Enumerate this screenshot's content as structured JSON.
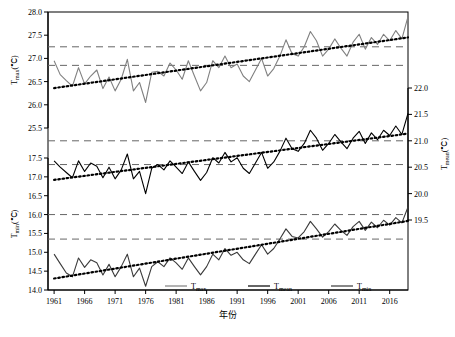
{
  "chart_data": {
    "type": "line",
    "title": "",
    "xlabel": "年份",
    "x_ticks": [
      1961,
      1966,
      1971,
      1976,
      1981,
      1986,
      1991,
      1996,
      2001,
      2006,
      2011,
      2016
    ],
    "xlim": [
      1960,
      2019
    ],
    "panels": [
      {
        "name": "tmax-panel",
        "axis_side": "left",
        "ylabel": "T",
        "ylabel_sub": "max",
        "ylabel_unit": "(℃)",
        "ylim": [
          25.5,
          28.0
        ],
        "y_ticks": [
          25.5,
          26.0,
          26.5,
          27.0,
          27.5,
          28.0
        ],
        "mean_line": 26.85,
        "upper_dashed": 27.25,
        "series_name": "Tmax",
        "color": "#808080",
        "values": [
          26.95,
          26.65,
          26.52,
          26.4,
          26.8,
          26.45,
          26.62,
          26.75,
          26.35,
          26.6,
          26.3,
          26.55,
          26.98,
          26.3,
          26.48,
          26.05,
          26.7,
          26.72,
          26.62,
          26.9,
          26.75,
          26.55,
          26.95,
          26.62,
          26.3,
          26.48,
          26.95,
          26.8,
          27.05,
          26.8,
          26.88,
          26.62,
          26.5,
          26.75,
          27.0,
          26.62,
          26.78,
          27.05,
          27.4,
          27.1,
          27.05,
          27.25,
          27.58,
          27.38,
          27.05,
          27.2,
          27.42,
          27.22,
          27.05,
          27.35,
          27.52,
          27.2,
          27.45,
          27.3,
          27.52,
          27.38,
          27.6,
          27.42,
          27.9
        ]
      },
      {
        "name": "tmean-panel",
        "axis_side": "right",
        "ylabel": "T",
        "ylabel_sub": "mean",
        "ylabel_unit": "(℃)",
        "ylim": [
          19.5,
          22.0
        ],
        "y_ticks": [
          19.5,
          20.0,
          20.5,
          21.0,
          21.5,
          22.0
        ],
        "mean_line": 20.55,
        "upper_dashed": 21.0,
        "series_name": "Tmean",
        "color": "#000000",
        "values": [
          20.62,
          20.5,
          20.4,
          20.3,
          20.62,
          20.42,
          20.58,
          20.52,
          20.3,
          20.5,
          20.28,
          20.45,
          20.75,
          20.28,
          20.42,
          20.0,
          20.48,
          20.55,
          20.45,
          20.62,
          20.5,
          20.38,
          20.6,
          20.42,
          20.25,
          20.4,
          20.68,
          20.58,
          20.78,
          20.6,
          20.68,
          20.48,
          20.38,
          20.58,
          20.78,
          20.48,
          20.6,
          20.8,
          21.05,
          20.85,
          20.8,
          20.95,
          21.2,
          21.05,
          20.82,
          20.95,
          21.12,
          20.98,
          20.85,
          21.05,
          21.18,
          20.95,
          21.15,
          21.02,
          21.2,
          21.1,
          21.28,
          21.12,
          21.52
        ]
      },
      {
        "name": "tmin-panel",
        "axis_side": "left",
        "ylabel": "T",
        "ylabel_sub": "min",
        "ylabel_unit": "(℃)",
        "ylim": [
          14.0,
          17.5
        ],
        "y_ticks": [
          14.0,
          14.5,
          15.0,
          15.5,
          16.0,
          16.5,
          17.0,
          17.5
        ],
        "mean_line": 15.35,
        "upper_dashed": 16.0,
        "series_name": "Tmin",
        "color": "#3a3a3a",
        "values": [
          14.95,
          14.7,
          14.45,
          14.35,
          14.85,
          14.6,
          14.8,
          14.72,
          14.4,
          14.68,
          14.35,
          14.62,
          14.95,
          14.35,
          14.58,
          14.1,
          14.62,
          14.75,
          14.62,
          14.85,
          14.72,
          14.55,
          14.85,
          14.62,
          14.4,
          14.62,
          14.95,
          14.8,
          15.1,
          14.92,
          15.0,
          14.8,
          14.7,
          14.95,
          15.2,
          14.95,
          15.1,
          15.35,
          15.62,
          15.42,
          15.38,
          15.55,
          15.82,
          15.62,
          15.4,
          15.55,
          15.75,
          15.58,
          15.45,
          15.68,
          15.82,
          15.58,
          15.8,
          15.65,
          15.85,
          15.72,
          15.92,
          15.78,
          16.2
        ]
      }
    ],
    "legend": [
      {
        "label": "Tmax",
        "sub": "max",
        "color": "#808080"
      },
      {
        "label": "Tmean",
        "sub": "mean",
        "color": "#000000"
      },
      {
        "label": "Tmin",
        "sub": "min",
        "color": "#3a3a3a"
      }
    ],
    "grid": false,
    "legend_position": "bottom-center",
    "trend_style": "dotted",
    "mean_style": "dashed"
  }
}
